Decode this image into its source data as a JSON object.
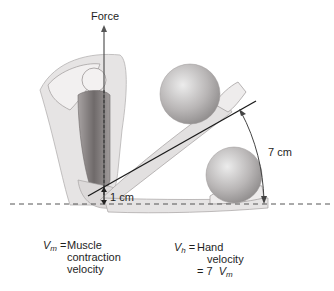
{
  "diagram": {
    "labels": {
      "force": "Force",
      "short_distance": "1 cm",
      "long_distance": "7 cm"
    },
    "legend": {
      "vm": {
        "symbol": "V",
        "subscript": "m",
        "equals": "=",
        "line1": "Muscle",
        "line2": "contraction",
        "line3": "velocity"
      },
      "vh": {
        "symbol": "V",
        "subscript": "h",
        "equals": "=",
        "line1": "Hand",
        "line2": "velocity",
        "line3_prefix": "= 7",
        "line3_symbol": "V",
        "line3_subscript": "m"
      }
    },
    "colors": {
      "skin": "#e4e2e2",
      "muscle": "#8a8585",
      "bone": "#f4f2f2",
      "ball": "#bdbaba",
      "line": "#1a1a1a",
      "dashed": "#555555"
    }
  }
}
